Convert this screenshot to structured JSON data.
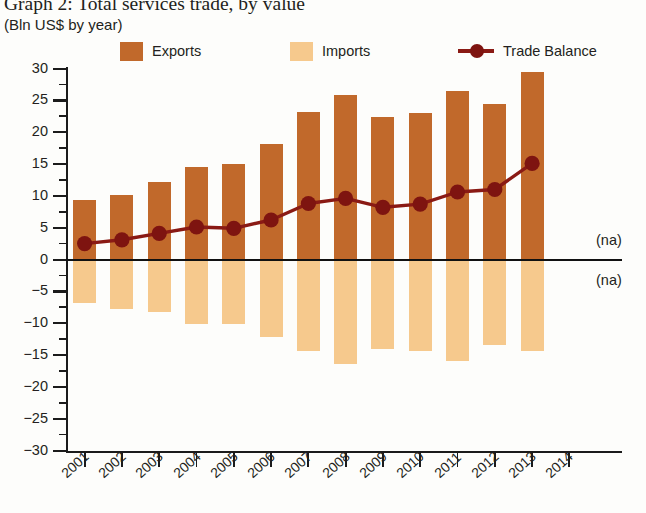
{
  "header": {
    "title": "Graph 2: Total services trade, by value",
    "subtitle": "(Bln US$ by year)"
  },
  "legend": {
    "items": [
      {
        "label": "Exports",
        "type": "swatch",
        "color": "#C1692B",
        "icon": "square-swatch-icon"
      },
      {
        "label": "Imports",
        "type": "swatch",
        "color": "#F6C98D",
        "icon": "square-swatch-icon"
      },
      {
        "label": "Trade Balance",
        "type": "line-marker",
        "color": "#8A1A14",
        "icon": "line-marker-icon"
      }
    ]
  },
  "annotations": [
    {
      "text": "(na)",
      "position": "above-zero-right"
    },
    {
      "text": "(na)",
      "position": "below-zero-right"
    }
  ],
  "colors": {
    "exports": "#C1692B",
    "imports": "#F6C98D",
    "trade_balance": "#8A1A14",
    "axis": "#1B1B1B",
    "text": "#231F20",
    "background": "#FDFDFB"
  },
  "chart_data": {
    "type": "bar",
    "title": "Graph 2: Total services trade, by value",
    "subtitle": "(Bln US$ by year)",
    "xlabel": "",
    "ylabel": "Bln US$",
    "ylim": [
      -30,
      30
    ],
    "yticks": [
      30,
      25,
      20,
      15,
      10,
      5,
      0,
      -5,
      -10,
      -15,
      -20,
      -25,
      -30
    ],
    "ytick_labels": [
      "30",
      "25",
      "20",
      "15",
      "10",
      "5",
      "0",
      "−5",
      "−10",
      "−15",
      "−20",
      "−25",
      "−30"
    ],
    "categories": [
      "2001",
      "2002",
      "2003",
      "2004",
      "2005",
      "2006",
      "2007",
      "2008",
      "2009",
      "2010",
      "2011",
      "2012",
      "2013",
      "2014"
    ],
    "grid": false,
    "legend_position": "top",
    "series": [
      {
        "name": "Exports",
        "type": "bar",
        "color": "#C1692B",
        "values": [
          9.4,
          10.1,
          12.2,
          14.6,
          15.0,
          18.2,
          23.1,
          25.9,
          22.4,
          23.0,
          26.4,
          24.4,
          29.4,
          null
        ]
      },
      {
        "name": "Imports",
        "type": "bar",
        "color": "#F6C98D",
        "values": [
          -6.9,
          -7.7,
          -8.3,
          -10.1,
          -10.2,
          -12.1,
          -14.3,
          -16.4,
          -14.1,
          -14.3,
          -15.9,
          -13.4,
          -14.3,
          null
        ]
      },
      {
        "name": "Trade Balance",
        "type": "line",
        "color": "#8A1A14",
        "values": [
          2.5,
          3.1,
          4.1,
          5.1,
          4.9,
          6.2,
          8.8,
          9.6,
          8.2,
          8.7,
          10.6,
          11.0,
          15.1,
          null
        ]
      }
    ],
    "missing_value_note": "(na)"
  }
}
